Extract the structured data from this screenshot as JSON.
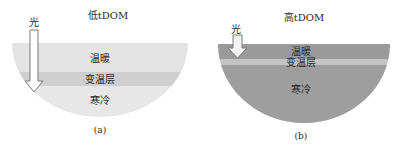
{
  "figure": {
    "panels": [
      {
        "id": "a",
        "title": "低tDOM",
        "light_label": "光",
        "layers": {
          "top": "温暖",
          "middle": "变温层",
          "bottom": "寒冷"
        },
        "caption": "(a)",
        "colors": {
          "warm": "#e4e4e4",
          "thermocline": "#cfcfcf",
          "cold": "#e7e7e7",
          "arrow_fill": "#ffffff",
          "arrow_stroke": "#7a7a7a"
        }
      },
      {
        "id": "b",
        "title": "高tDOM",
        "light_label": "光",
        "layers": {
          "top": "温暖",
          "middle": "变温层",
          "bottom": "寒冷"
        },
        "caption": "(b)",
        "colors": {
          "warm": "#9a9a9a",
          "thermocline": "#c4c4c4",
          "cold": "#9e9e9e",
          "arrow_fill": "#f2f2f2",
          "arrow_stroke": "#7a7a7a"
        }
      }
    ]
  }
}
